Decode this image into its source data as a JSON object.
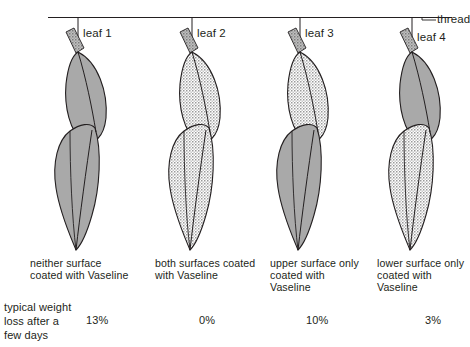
{
  "figure": {
    "thread_label": "thread",
    "left_legend_line1": "typical weight",
    "left_legend_line2": "loss after a",
    "left_legend_line3": "few days",
    "colors": {
      "outline": "#231f20",
      "uncoated_fill": "#a9a9a9",
      "coated_fill": "#ffffff",
      "coated_dot": "#8a8a8a",
      "petiole_fill": "#9e9e9e",
      "thread": "#231f20",
      "text": "#231f20"
    },
    "surface_states": {
      "uncoated": "gray-shaded",
      "coated": "stippled-dotted"
    }
  },
  "leaves": [
    {
      "id": "leaf-1",
      "label": "leaf 1",
      "caption_lines": [
        "neither surface",
        "coated with Vaseline"
      ],
      "weight_loss": "13%",
      "upper_surface": "uncoated",
      "lower_surface": "uncoated"
    },
    {
      "id": "leaf-2",
      "label": "leaf 2",
      "caption_lines": [
        "both surfaces coated",
        "with Vaseline"
      ],
      "weight_loss": "0%",
      "upper_surface": "coated",
      "lower_surface": "coated"
    },
    {
      "id": "leaf-3",
      "label": "leaf 3",
      "caption_lines": [
        "upper surface only",
        "coated with",
        "Vaseline"
      ],
      "weight_loss": "10%",
      "upper_surface": "coated",
      "lower_surface": "uncoated"
    },
    {
      "id": "leaf-4",
      "label": "leaf 4",
      "caption_lines": [
        "lower surface only",
        "coated with",
        "Vaseline"
      ],
      "weight_loss": "3%",
      "upper_surface": "uncoated",
      "lower_surface": "coated"
    }
  ]
}
